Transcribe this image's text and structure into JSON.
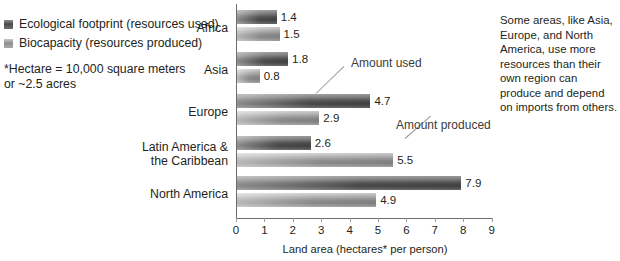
{
  "legend": {
    "items": [
      {
        "label": "Ecological footprint (resources used)",
        "swatch": "used-swatch",
        "color": "#4a4a4a"
      },
      {
        "label": "Biocapacity (resources produced)",
        "swatch": "produced-swatch",
        "color": "#8f8f8f"
      }
    ]
  },
  "note": {
    "line1": "*Hectare = 10,000 square meters",
    "line2": "or ~2.5 acres"
  },
  "callouts": {
    "used": "Amount used",
    "produced": "Amount produced"
  },
  "side_note": "Some areas, like Asia, Europe, and North America, use more resources than their own region can produce and depend on imports from others.",
  "chart_data": {
    "type": "bar",
    "orientation": "horizontal",
    "title": "",
    "xlabel": "Land area (hectares* per person)",
    "ylabel": "",
    "xlim": [
      0,
      9
    ],
    "xticks": [
      "0",
      "1",
      "2",
      "3",
      "4",
      "5",
      "6",
      "7",
      "8",
      "9"
    ],
    "grid": false,
    "legend_position": "top-left-outside",
    "categories": [
      "Africa",
      "Asia",
      "Europe",
      "Latin America &\nthe Caribbean",
      "North America"
    ],
    "series": [
      {
        "name": "Ecological footprint (resources used)",
        "values": [
          1.4,
          1.8,
          4.7,
          2.6,
          7.9
        ],
        "labels": [
          "1.4",
          "1.8",
          "4.7",
          "2.6",
          "7.9"
        ]
      },
      {
        "name": "Biocapacity (resources produced)",
        "values": [
          1.5,
          0.8,
          2.9,
          5.5,
          4.9
        ],
        "labels": [
          "1.5",
          "0.8",
          "2.9",
          "5.5",
          "4.9"
        ]
      }
    ],
    "annotations": [
      {
        "text": "Amount used",
        "points_to": "Europe / resources used bar"
      },
      {
        "text": "Amount produced",
        "points_to": "Latin America & the Caribbean / resources produced bar"
      }
    ]
  }
}
